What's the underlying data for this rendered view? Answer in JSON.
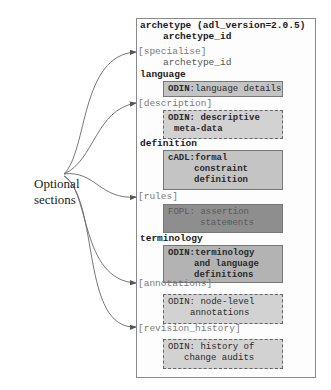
{
  "label": {
    "line1": "Optional",
    "line2": "sections"
  },
  "archetype": {
    "header": "archetype (adl_version=2.0.5)",
    "header_id": "archetype_id",
    "specialise": "[specialise]",
    "specialise_id": "archetype_id",
    "language": "language",
    "language_box": {
      "bold": "ODIN",
      "text": ":language details"
    },
    "description": "[description]",
    "description_box": {
      "line1": "ODIN: descriptive",
      "line2": "meta-data"
    },
    "definition": "definition",
    "definition_box": {
      "line1": "cADL:formal",
      "line2": "constraint",
      "line3": "definition"
    },
    "rules": "[rules]",
    "rules_box": {
      "line1": "FOPL: assertion",
      "line2": "statements"
    },
    "terminology": "terminology",
    "terminology_box": {
      "line1": "ODIN:terminology",
      "line2": "and language",
      "line3": "definitions"
    },
    "annotations": "[annotations]",
    "annotations_box": {
      "line1": "ODIN: node-level",
      "line2": "annotations"
    },
    "revision_history": "[revision_history]",
    "revision_history_box": {
      "line1": "ODIN: history of",
      "line2": "change audits"
    }
  },
  "colors": {
    "box_light": "#c4c4c4",
    "box_dashed": "#d2d2d2",
    "box_dark": "#8e8e8e",
    "optional_text": "#7a7a7a"
  }
}
